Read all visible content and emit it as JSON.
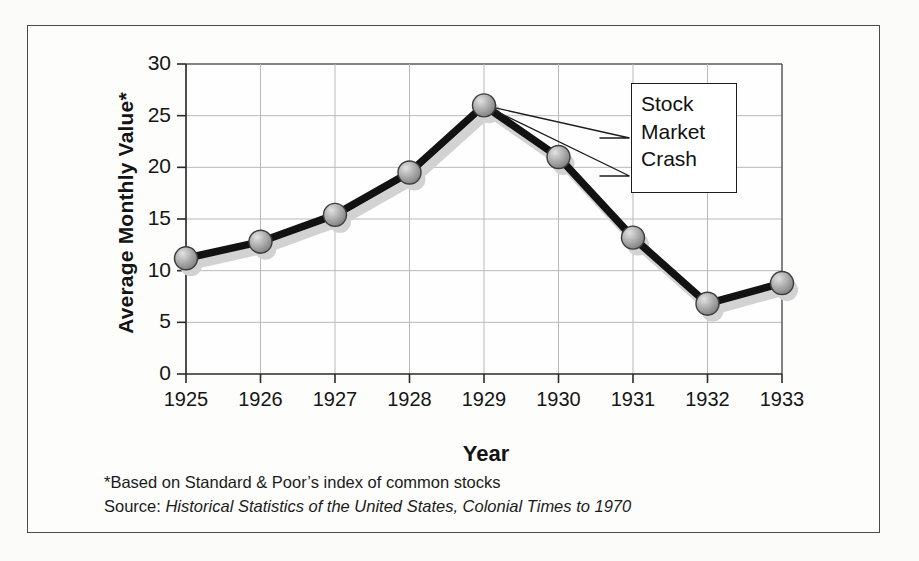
{
  "chart_data": {
    "type": "line",
    "title": "",
    "xlabel": "Year",
    "ylabel": "Average Monthly Value*",
    "categories": [
      "1925",
      "1926",
      "1927",
      "1928",
      "1929",
      "1930",
      "1931",
      "1932",
      "1933"
    ],
    "values": [
      11.2,
      12.8,
      15.4,
      19.5,
      26.0,
      21.0,
      13.2,
      6.8,
      8.8
    ],
    "series": [
      {
        "name": "Average Monthly Value",
        "values": [
          11.2,
          12.8,
          15.4,
          19.5,
          26.0,
          21.0,
          13.2,
          6.8,
          8.8
        ]
      }
    ],
    "x": [
      1925,
      1926,
      1927,
      1928,
      1929,
      1930,
      1931,
      1932,
      1933
    ],
    "ylim": [
      0,
      30
    ],
    "xlim": [
      1925,
      1933
    ],
    "yticks": [
      "0",
      "5",
      "10",
      "15",
      "20",
      "25",
      "30"
    ],
    "ytick_values": [
      0,
      5,
      10,
      15,
      20,
      25,
      30
    ],
    "grid": true,
    "legend": "none",
    "annotations": [
      {
        "text": "Stock Market Crash",
        "lines": [
          "Stock",
          "Market",
          "Crash"
        ],
        "points_to": {
          "x": 1929,
          "y": 26.0
        }
      }
    ],
    "line_color": "#101010",
    "marker_color": "#9a9a9a",
    "shadow_color": "#cfcfcf",
    "grid_color": "#b6b6b6"
  },
  "axes": {
    "y_ticks": [
      "30",
      "25",
      "20",
      "15",
      "10",
      "5",
      "0"
    ],
    "x_ticks": [
      "1925",
      "1926",
      "1927",
      "1928",
      "1929",
      "1930",
      "1931",
      "1932",
      "1933"
    ],
    "y_axis_title": "Average Monthly Value*",
    "x_axis_title": "Year"
  },
  "callout": {
    "line1": "Stock",
    "line2": "Market",
    "line3": "Crash"
  },
  "footnotes": {
    "note": "*Based on Standard & Poor’s index of common stocks",
    "source_prefix": "Source: ",
    "source_title": "Historical Statistics of the United States, Colonial Times to 1970"
  }
}
